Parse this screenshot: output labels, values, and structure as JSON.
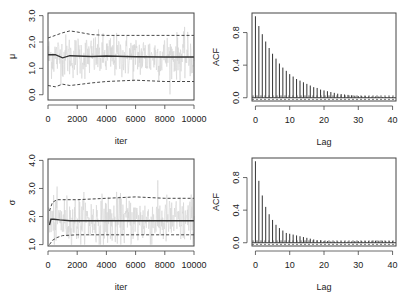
{
  "chart_data": [
    {
      "type": "line",
      "panel": "trace-mu",
      "title": "",
      "xlabel": "iter",
      "ylabel": "μ",
      "xlim": [
        0,
        10000
      ],
      "ylim": [
        -0.2,
        3.1
      ],
      "xticks": [
        0,
        2000,
        4000,
        6000,
        8000,
        10000
      ],
      "xtick_labels": [
        "0",
        "2000",
        "4000",
        "6000",
        "8000",
        "10000"
      ],
      "yticks": [
        0.0,
        1.0,
        2.0,
        3.0
      ],
      "ytick_labels": [
        "0.0",
        "1.0",
        "2.0",
        "3.0"
      ],
      "grid": false,
      "series": [
        {
          "name": "trace",
          "style": "light-gray",
          "center": 1.45,
          "spread": 0.75
        },
        {
          "name": "running mean",
          "style": "solid-dark",
          "x": [
            0,
            500,
            1000,
            1500,
            2000,
            3000,
            4000,
            6000,
            8000,
            10000
          ],
          "values": [
            1.52,
            1.52,
            1.4,
            1.48,
            1.47,
            1.45,
            1.47,
            1.44,
            1.43,
            1.43
          ]
        },
        {
          "name": "upper quantile",
          "style": "dashed",
          "x": [
            0,
            500,
            1000,
            1500,
            2000,
            3000,
            4000,
            6000,
            8000,
            10000
          ],
          "values": [
            2.15,
            2.25,
            2.35,
            2.42,
            2.38,
            2.28,
            2.25,
            2.25,
            2.25,
            2.25
          ]
        },
        {
          "name": "lower quantile",
          "style": "dashed",
          "x": [
            0,
            500,
            1000,
            1500,
            2000,
            3000,
            4000,
            6000,
            8000,
            10000
          ],
          "values": [
            0.35,
            0.3,
            0.4,
            0.35,
            0.38,
            0.45,
            0.5,
            0.55,
            0.5,
            0.5
          ]
        }
      ]
    },
    {
      "type": "bar",
      "panel": "acf-mu",
      "title": "",
      "xlabel": "Lag",
      "ylabel": "ACF",
      "xlim": [
        -1,
        41
      ],
      "ylim": [
        -0.04,
        1.04
      ],
      "xticks": [
        0,
        10,
        20,
        30,
        40
      ],
      "xtick_labels": [
        "0",
        "10",
        "20",
        "30",
        "40"
      ],
      "yticks": [
        0.0,
        0.4,
        0.8
      ],
      "ytick_labels": [
        "0.0",
        "0.4",
        "0.8"
      ],
      "grid": false,
      "ci": 0.02,
      "categories": [
        0,
        1,
        2,
        3,
        4,
        5,
        6,
        7,
        8,
        9,
        10,
        11,
        12,
        13,
        14,
        15,
        16,
        17,
        18,
        19,
        20,
        21,
        22,
        23,
        24,
        25,
        26,
        27,
        28,
        29,
        30,
        31,
        32,
        33,
        34,
        35,
        36,
        37,
        38,
        39,
        40
      ],
      "values": [
        1.0,
        0.88,
        0.78,
        0.69,
        0.61,
        0.54,
        0.48,
        0.42,
        0.37,
        0.33,
        0.29,
        0.26,
        0.23,
        0.21,
        0.19,
        0.17,
        0.15,
        0.13,
        0.12,
        0.1,
        0.09,
        0.08,
        0.07,
        0.06,
        0.05,
        0.045,
        0.04,
        0.035,
        0.03,
        0.025,
        0.02,
        0.02,
        0.02,
        0.015,
        0.015,
        0.015,
        0.015,
        0.01,
        0.01,
        0.01,
        0.01
      ]
    },
    {
      "type": "line",
      "panel": "trace-sigma",
      "title": "",
      "xlabel": "iter",
      "ylabel": "σ",
      "xlim": [
        0,
        10000
      ],
      "ylim": [
        0.95,
        4.05
      ],
      "xticks": [
        0,
        2000,
        4000,
        6000,
        8000,
        10000
      ],
      "xtick_labels": [
        "0",
        "2000",
        "4000",
        "6000",
        "8000",
        "10000"
      ],
      "yticks": [
        1.0,
        2.0,
        3.0,
        4.0
      ],
      "ytick_labels": [
        "1.0",
        "2.0",
        "3.0",
        "4.0"
      ],
      "grid": false,
      "series": [
        {
          "name": "trace",
          "style": "light-gray",
          "center": 1.85,
          "spread": 0.8
        },
        {
          "name": "running mean",
          "style": "solid-dark",
          "x": [
            100,
            200,
            400,
            800,
            1500,
            3000,
            6000,
            10000
          ],
          "values": [
            1.7,
            1.9,
            1.9,
            1.88,
            1.85,
            1.85,
            1.85,
            1.85
          ]
        },
        {
          "name": "upper quantile",
          "style": "dashed",
          "x": [
            100,
            300,
            600,
            1000,
            2000,
            4000,
            6000,
            8000,
            10000
          ],
          "values": [
            2.2,
            2.5,
            2.6,
            2.6,
            2.6,
            2.65,
            2.7,
            2.65,
            2.65
          ]
        },
        {
          "name": "lower quantile",
          "style": "dashed",
          "x": [
            100,
            300,
            600,
            1000,
            2000,
            4000,
            6000,
            8000,
            10000
          ],
          "values": [
            1.0,
            1.15,
            1.25,
            1.32,
            1.35,
            1.35,
            1.35,
            1.35,
            1.35
          ]
        }
      ]
    },
    {
      "type": "bar",
      "panel": "acf-sigma",
      "title": "",
      "xlabel": "Lag",
      "ylabel": "ACF",
      "xlim": [
        -1,
        41
      ],
      "ylim": [
        -0.04,
        1.04
      ],
      "xticks": [
        0,
        10,
        20,
        30,
        40
      ],
      "xtick_labels": [
        "0",
        "10",
        "20",
        "30",
        "40"
      ],
      "yticks": [
        0.0,
        0.4,
        0.8
      ],
      "ytick_labels": [
        "0.0",
        "0.4",
        "0.8"
      ],
      "grid": false,
      "ci": 0.02,
      "categories": [
        0,
        1,
        2,
        3,
        4,
        5,
        6,
        7,
        8,
        9,
        10,
        11,
        12,
        13,
        14,
        15,
        16,
        17,
        18,
        19,
        20,
        21,
        22,
        23,
        24,
        25,
        26,
        27,
        28,
        29,
        30,
        31,
        32,
        33,
        34,
        35,
        36,
        37,
        38,
        39,
        40
      ],
      "values": [
        1.0,
        0.76,
        0.58,
        0.44,
        0.35,
        0.28,
        0.22,
        0.18,
        0.15,
        0.12,
        0.11,
        0.1,
        0.09,
        0.08,
        0.07,
        0.06,
        0.05,
        0.04,
        0.03,
        0.03,
        0.02,
        0.02,
        0.015,
        0.015,
        0.015,
        0.015,
        0.015,
        0.015,
        0.015,
        0.02,
        0.02,
        0.02,
        0.02,
        0.02,
        0.025,
        0.025,
        0.025,
        0.025,
        0.02,
        0.02,
        0.02
      ]
    }
  ],
  "colors": {
    "trace": "#d4d4d4",
    "line": "#333333",
    "axis": "#444444",
    "text": "#222222"
  }
}
